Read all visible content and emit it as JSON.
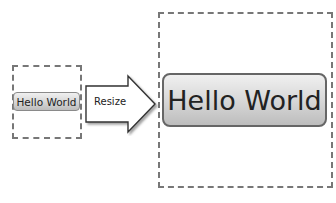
{
  "diagram": {
    "source_button": {
      "label": "Hello World"
    },
    "arrow": {
      "label": "Resize"
    },
    "target_button": {
      "label": "Hello World"
    },
    "caption": ""
  }
}
